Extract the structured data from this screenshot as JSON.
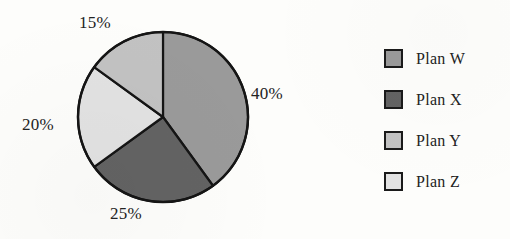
{
  "chart_data": {
    "type": "pie",
    "title": "",
    "subtitle": "",
    "xlabel": "",
    "ylabel": "",
    "grid": false,
    "legend_position": "right",
    "start_angle_deg": 0,
    "direction": "clockwise",
    "categories": [
      "Plan W",
      "Plan X",
      "Plan Y",
      "Plan Z"
    ],
    "values": [
      40,
      25,
      15,
      20
    ],
    "value_unit": "%",
    "slices": [
      {
        "label": "Plan W",
        "value": 40,
        "data_label": "40%",
        "color": "#9a9a9a",
        "start_deg": 0,
        "end_deg": 144
      },
      {
        "label": "Plan X",
        "value": 25,
        "data_label": "25%",
        "color": "#636363",
        "start_deg": 144,
        "end_deg": 234
      },
      {
        "label": "Plan Z",
        "value": 20,
        "data_label": "20%",
        "color": "#e2e2e2",
        "start_deg": 234,
        "end_deg": 306
      },
      {
        "label": "Plan Y",
        "value": 15,
        "data_label": "15%",
        "color": "#c2c2c2",
        "start_deg": 306,
        "end_deg": 360
      }
    ],
    "data_labels": [
      "40%",
      "25%",
      "20%",
      "15%"
    ],
    "annotations": []
  },
  "pie": {
    "outline_color": "#151515",
    "center_x": 163,
    "center_y": 117,
    "radius": 85,
    "labels": {
      "pct_15": "15%",
      "pct_40": "40%",
      "pct_20": "20%",
      "pct_25": "25%"
    }
  },
  "legend": {
    "items": [
      {
        "label": "Plan W",
        "color": "#9a9a9a"
      },
      {
        "label": "Plan X",
        "color": "#636363"
      },
      {
        "label": "Plan Y",
        "color": "#c2c2c2"
      },
      {
        "label": "Plan Z",
        "color": "#e2e2e2"
      }
    ]
  }
}
